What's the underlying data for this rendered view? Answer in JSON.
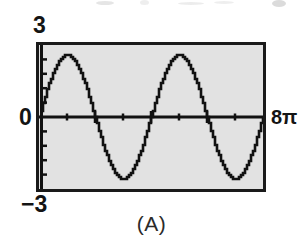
{
  "figure": {
    "caption": "(A)",
    "frame_color": "#1a1a1a",
    "plot_background": "#e2e2e2",
    "curve_color": "#111111"
  },
  "labels": {
    "y_max": "3",
    "y_min": "−3",
    "origin": "0",
    "x_max": "8π"
  },
  "chart_data": {
    "type": "line",
    "title": "(A)",
    "xlabel": "",
    "ylabel": "",
    "xlim": [
      0,
      25.1327
    ],
    "ylim": [
      -3,
      3
    ],
    "x_tick_labels": [
      "0",
      "8π"
    ],
    "y_tick_labels": [
      "3",
      "0",
      "−3"
    ],
    "x_major_ticks": [
      6.2832,
      12.5664,
      18.8496
    ],
    "x_minor_ticks": [
      3.1416,
      9.4248,
      15.708,
      21.9911
    ],
    "y_major_ticks": [
      -3,
      0,
      3
    ],
    "y_minor_ticks": [
      -2.4,
      -1.8,
      -1.2,
      -0.6,
      0.6,
      1.2,
      1.8,
      2.4
    ],
    "grid": false,
    "legend": null,
    "series": [
      {
        "name": "y = 2.6 sin(x/2)",
        "amplitude": 2.6,
        "period": 12.5664,
        "cycles": 2,
        "phase": 0,
        "x": [
          0.0,
          0.5027,
          1.0053,
          1.508,
          2.0106,
          2.5133,
          3.0159,
          3.5186,
          4.0212,
          4.5239,
          5.0265,
          5.5292,
          6.0319,
          6.5345,
          7.0372,
          7.5398,
          8.0425,
          8.5451,
          9.0478,
          9.5504,
          10.0531,
          10.5558,
          11.0584,
          11.5611,
          12.0637,
          12.5664,
          13.069,
          13.5717,
          14.0743,
          14.577,
          15.0796,
          15.5823,
          16.085,
          16.5876,
          17.0903,
          17.5929,
          18.0956,
          18.5982,
          19.1009,
          19.6035,
          20.1062,
          20.6088,
          21.1115,
          21.6142,
          22.1168,
          22.6195,
          23.1221,
          23.6248,
          24.1274,
          24.6301,
          25.1327
        ],
        "y": [
          0.0,
          0.646,
          1.2212,
          1.6705,
          1.9593,
          2.0757,
          2.0257,
          1.8296,
          1.5182,
          1.1274,
          0.6935,
          0.2493,
          -0.1785,
          -0.5671,
          -0.8993,
          -1.1633,
          -1.3532,
          -1.4684,
          -1.5131,
          -1.4955,
          -1.4271,
          -1.3216,
          -1.1939,
          -1.0591,
          -0.9314,
          -0.8233,
          -0.7449,
          -0.7033,
          -0.7024,
          -0.7427,
          -0.8216,
          -0.9333,
          -1.0693,
          -1.2192,
          -1.3712,
          -1.5129,
          -1.6324,
          -1.7187,
          -1.7627,
          -1.7578,
          -1.7004,
          -1.5904,
          -1.4313,
          -1.2301,
          -0.9973,
          -0.7459,
          -0.4911,
          -0.2492,
          -0.0368,
          0.1301,
          0.2384
        ]
      }
    ],
    "plotted_function": "y = 2.6 sin(x / 2) on 0 ≤ x ≤ 8π"
  }
}
